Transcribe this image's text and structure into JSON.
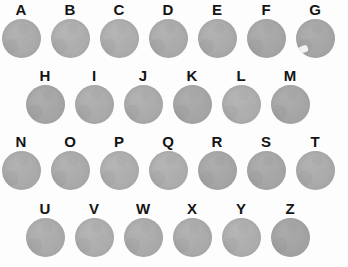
{
  "figure": {
    "background_color": "#fdfdfd",
    "specimen_fill_color": "#a9a9a9",
    "label_color": "#141414",
    "total_specimens": 26,
    "rows": [
      {
        "row_index": 1,
        "indented": false,
        "count": 7,
        "specimens": [
          {
            "label": "A",
            "shade": "shade-b",
            "notch": false
          },
          {
            "label": "B",
            "shade": "shade-c",
            "notch": false
          },
          {
            "label": "C",
            "shade": "shade-c",
            "notch": false
          },
          {
            "label": "D",
            "shade": "shade-b",
            "notch": false
          },
          {
            "label": "E",
            "shade": "shade-b",
            "notch": false
          },
          {
            "label": "F",
            "shade": "shade-a",
            "notch": false
          },
          {
            "label": "G",
            "shade": "shade-a",
            "notch": true
          }
        ]
      },
      {
        "row_index": 2,
        "indented": true,
        "count": 6,
        "specimens": [
          {
            "label": "H",
            "shade": "shade-a",
            "notch": false
          },
          {
            "label": "I",
            "shade": "shade-b",
            "notch": false
          },
          {
            "label": "J",
            "shade": "shade-b",
            "notch": false
          },
          {
            "label": "K",
            "shade": "shade-a",
            "notch": false
          },
          {
            "label": "L",
            "shade": "shade-c",
            "notch": false
          },
          {
            "label": "M",
            "shade": "shade-a",
            "notch": false
          }
        ]
      },
      {
        "row_index": 3,
        "indented": false,
        "count": 7,
        "specimens": [
          {
            "label": "N",
            "shade": "shade-b",
            "notch": false
          },
          {
            "label": "O",
            "shade": "shade-b",
            "notch": false
          },
          {
            "label": "P",
            "shade": "shade-c",
            "notch": false
          },
          {
            "label": "Q",
            "shade": "shade-c",
            "notch": false
          },
          {
            "label": "R",
            "shade": "shade-a",
            "notch": false
          },
          {
            "label": "S",
            "shade": "shade-a",
            "notch": false
          },
          {
            "label": "T",
            "shade": "shade-b",
            "notch": false
          }
        ]
      },
      {
        "row_index": 4,
        "indented": true,
        "count": 6,
        "specimens": [
          {
            "label": "U",
            "shade": "shade-b",
            "notch": false
          },
          {
            "label": "V",
            "shade": "shade-c",
            "notch": false
          },
          {
            "label": "W",
            "shade": "shade-b",
            "notch": false
          },
          {
            "label": "X",
            "shade": "shade-b",
            "notch": false
          },
          {
            "label": "Y",
            "shade": "shade-c",
            "notch": false
          },
          {
            "label": "Z",
            "shade": "shade-d",
            "notch": false
          }
        ]
      }
    ]
  }
}
